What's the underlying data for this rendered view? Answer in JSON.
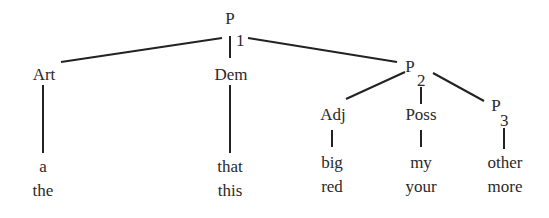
{
  "tree": {
    "root": {
      "symbol": "P",
      "subscript": "1"
    },
    "nodes": {
      "art": {
        "label": "Art",
        "words": [
          "a",
          "the"
        ]
      },
      "dem": {
        "label": "Dem",
        "words": [
          "that",
          "this"
        ]
      },
      "p2": {
        "symbol": "P",
        "subscript": "2"
      },
      "adj": {
        "label": "Adj",
        "words": [
          "big",
          "red"
        ]
      },
      "poss": {
        "label": "Poss",
        "words": [
          "my",
          "your"
        ]
      },
      "p3": {
        "symbol": "P",
        "subscript": "3",
        "words": [
          "other",
          "more"
        ]
      }
    },
    "edges": [
      [
        "P1",
        "Art"
      ],
      [
        "P1",
        "Dem"
      ],
      [
        "P1",
        "P2"
      ],
      [
        "P2",
        "Adj"
      ],
      [
        "P2",
        "Poss"
      ],
      [
        "P2",
        "P3"
      ],
      [
        "Art",
        "a/the"
      ],
      [
        "Dem",
        "that/this"
      ],
      [
        "Adj",
        "big/red"
      ],
      [
        "Poss",
        "my/your"
      ],
      [
        "P3",
        "other/more"
      ]
    ]
  }
}
